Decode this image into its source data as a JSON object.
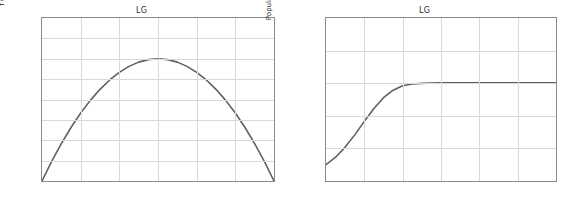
{
  "figure": {
    "background": "#ffffff",
    "curve_color": "#606060",
    "grid_color": "#d9d9d9",
    "spine_color": "#8a8a8a",
    "text_color": "#2b2b2b"
  },
  "chart_data": [
    {
      "type": "line",
      "title": "LG",
      "xlabel": "N",
      "ylabel": "f (N)",
      "xlim": [
        0,
        600
      ],
      "ylim": [
        0,
        400
      ],
      "xticks": [
        0,
        100,
        200,
        300,
        400,
        500,
        600
      ],
      "yticks": [
        0,
        50,
        100,
        150,
        200,
        250,
        300,
        350,
        400
      ],
      "grid": true,
      "legend": "none",
      "series": [
        {
          "name": "f(N) = 2 N (1 - N/600)",
          "x": [
            0,
            25,
            50,
            75,
            100,
            125,
            150,
            175,
            200,
            225,
            250,
            275,
            300,
            325,
            350,
            375,
            400,
            425,
            450,
            475,
            500,
            525,
            550,
            575,
            600
          ],
          "y": [
            0,
            47.9,
            91.7,
            131.3,
            166.7,
            197.9,
            225,
            247.9,
            266.7,
            281.3,
            291.7,
            297.9,
            300,
            297.9,
            291.7,
            281.3,
            266.7,
            247.9,
            225,
            197.9,
            166.7,
            131.3,
            91.7,
            47.9,
            0
          ]
        }
      ]
    },
    {
      "type": "line",
      "title": "LG",
      "xlabel": "Time t",
      "ylabel": "Population N",
      "xlim": [
        0,
        6
      ],
      "ylim": [
        0,
        1000
      ],
      "xticks": [
        0,
        1,
        2,
        3,
        4,
        5,
        6
      ],
      "yticks": [
        0,
        200,
        400,
        600,
        800,
        1000
      ],
      "grid": true,
      "legend": "none",
      "series": [
        {
          "name": "N(t) logistic, N0 = 100, K = 600",
          "x": [
            0,
            0.25,
            0.5,
            0.75,
            1,
            1.25,
            1.5,
            1.75,
            2,
            2.25,
            2.5,
            2.75,
            3,
            3.5,
            4,
            4.5,
            5,
            5.5,
            6
          ],
          "y": [
            100,
            146,
            208,
            283,
            366,
            445,
            511,
            557,
            584,
            595,
            599,
            601,
            602,
            602,
            602,
            602,
            602,
            602,
            602
          ]
        }
      ]
    }
  ]
}
